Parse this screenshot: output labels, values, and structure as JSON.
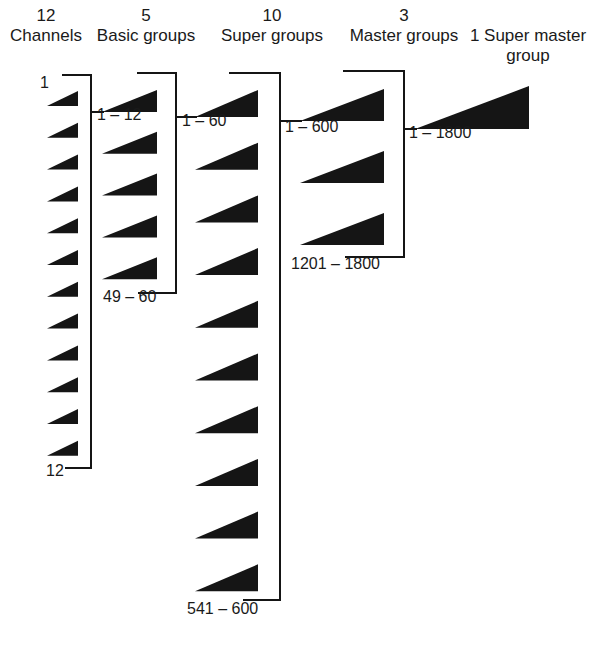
{
  "ink_color": "#151515",
  "headers": [
    {
      "count": "12",
      "name": "Channels",
      "cx": 46,
      "top": 6
    },
    {
      "count": "5",
      "name": "Basic groups",
      "cx": 146,
      "top": 6
    },
    {
      "count": "10",
      "name": "Super groups",
      "cx": 272,
      "top": 6
    },
    {
      "count": "3",
      "name": "Master groups",
      "cx": 404,
      "top": 6
    },
    {
      "count": "",
      "name": "1 Super master",
      "name2": "group",
      "cx": 528,
      "top": 26
    }
  ],
  "labels": [
    {
      "text": "1",
      "x": 40,
      "y": 83
    },
    {
      "text": "1 – 12",
      "x": 97,
      "y": 115
    },
    {
      "text": "12",
      "x": 46,
      "y": 471
    },
    {
      "text": "1 – 60",
      "x": 182,
      "y": 121
    },
    {
      "text": "49 – 60",
      "x": 103,
      "y": 297
    },
    {
      "text": "1 – 600",
      "x": 285,
      "y": 127
    },
    {
      "text": "541 – 600",
      "x": 187,
      "y": 609
    },
    {
      "text": "1 – 1800",
      "x": 409,
      "y": 133
    },
    {
      "text": "1201 – 1800",
      "x": 291,
      "y": 264
    }
  ],
  "stages": [
    {
      "name": "channels",
      "count": 12,
      "x_left": 47,
      "x_right": 78,
      "first_top": 91,
      "first_bottom": 106,
      "pitch": 31.8,
      "bracket": {
        "x": 91,
        "top": 75,
        "bottom": 468,
        "top_left": 62,
        "bottom_left": 65,
        "out_y": 112
      }
    },
    {
      "name": "basic-groups",
      "count": 5,
      "x_left": 102,
      "x_right": 157,
      "first_top": 90,
      "first_bottom": 112,
      "pitch": 41.8,
      "bracket": {
        "x": 176,
        "top": 73,
        "bottom": 293,
        "top_left": 137,
        "bottom_left": 138,
        "out_y": 118
      }
    },
    {
      "name": "super-groups",
      "count": 10,
      "x_left": 195,
      "x_right": 258,
      "first_top": 90,
      "first_bottom": 117,
      "pitch": 52.7,
      "bracket": {
        "x": 280,
        "top": 73,
        "bottom": 600,
        "top_left": 229,
        "bottom_left": 243,
        "out_y": 121
      }
    },
    {
      "name": "master-groups",
      "count": 3,
      "x_left": 300,
      "x_right": 384,
      "first_top": 89,
      "first_bottom": 121,
      "pitch": 62,
      "bracket": {
        "x": 404,
        "top": 71,
        "bottom": 257,
        "top_left": 343,
        "bottom_left": 345,
        "out_y": 128
      }
    },
    {
      "name": "super-master-group",
      "count": 1,
      "x_left": 415,
      "x_right": 529,
      "first_top": 86,
      "first_bottom": 129,
      "pitch": 0,
      "bracket": null
    }
  ]
}
